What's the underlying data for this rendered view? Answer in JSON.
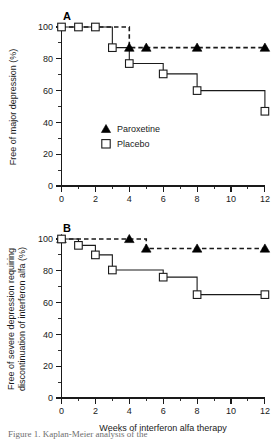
{
  "figure": {
    "panels": [
      {
        "letter": "A",
        "ylabel": "Free of major depression (%)",
        "xlabel": "",
        "legend": [
          {
            "label": "Paroxetine",
            "marker": "filled-triangle-icon"
          },
          {
            "label": "Placebo",
            "marker": "open-square-icon"
          }
        ]
      },
      {
        "letter": "B",
        "ylabel_line1": "Free of severe depression requiring",
        "ylabel_line2": "discontinuation of interferon alfa (%)",
        "xlabel": "Weeks of interferon alfa therapy",
        "legend": []
      }
    ],
    "caption_partial": "Figure 1. Kaplan-Meier analysis of the"
  },
  "chart_data": [
    {
      "type": "line",
      "title": "A",
      "subtitle": "",
      "xlabel": "",
      "ylabel": "Free of major depression (%)",
      "xlim": [
        0,
        12
      ],
      "ylim": [
        0,
        100
      ],
      "xticks": [
        0,
        2,
        4,
        6,
        8,
        10,
        12
      ],
      "xtick_labels": [
        "0",
        "2",
        "4",
        "6",
        "8",
        "10",
        "12"
      ],
      "yticks": [
        0,
        20,
        40,
        60,
        80,
        100
      ],
      "ytick_labels": [
        "0",
        "20",
        "40",
        "60",
        "80",
        "100"
      ],
      "x_minor_ticks": [
        1,
        3,
        5,
        7,
        9,
        11
      ],
      "y_minor_ticks": [
        10,
        30,
        50,
        70,
        90
      ],
      "grid": false,
      "legend_position": "inside-lower-left",
      "step_interpolation": "post",
      "series": [
        {
          "name": "Paroxetine",
          "line_style": "dashed",
          "marker": "filled-triangle",
          "x": [
            0,
            4,
            12
          ],
          "y": [
            100,
            87,
            87
          ],
          "marker_x": [
            4,
            5,
            8,
            12
          ],
          "marker_y": [
            87,
            87,
            87,
            87
          ]
        },
        {
          "name": "Placebo",
          "line_style": "solid",
          "marker": "open-square",
          "x": [
            0,
            1,
            2,
            3,
            4,
            6,
            8,
            12
          ],
          "y": [
            100,
            100,
            100,
            87,
            77,
            70.5,
            60,
            47
          ],
          "marker_x": [
            0,
            1,
            2,
            3,
            4,
            6,
            8,
            12
          ],
          "marker_y": [
            100,
            100,
            100,
            87,
            77,
            70.5,
            60,
            47
          ]
        }
      ]
    },
    {
      "type": "line",
      "title": "B",
      "subtitle": "",
      "xlabel": "Weeks of interferon alfa therapy",
      "ylabel": "Free of severe depression requiring discontinuation of interferon alfa (%)",
      "xlim": [
        0,
        12
      ],
      "ylim": [
        0,
        100
      ],
      "xticks": [
        0,
        2,
        4,
        6,
        8,
        10,
        12
      ],
      "xtick_labels": [
        "0",
        "2",
        "4",
        "6",
        "8",
        "10",
        "12"
      ],
      "yticks": [
        0,
        20,
        40,
        60,
        80,
        100
      ],
      "ytick_labels": [
        "0",
        "20",
        "40",
        "60",
        "80",
        "100"
      ],
      "x_minor_ticks": [
        1,
        3,
        5,
        7,
        9,
        11
      ],
      "y_minor_ticks": [
        10,
        30,
        50,
        70,
        90
      ],
      "grid": false,
      "legend_position": "none",
      "step_interpolation": "post",
      "series": [
        {
          "name": "Paroxetine",
          "line_style": "dashed",
          "marker": "filled-triangle",
          "x": [
            0,
            5,
            12
          ],
          "y": [
            100,
            94,
            94
          ],
          "marker_x": [
            0,
            4,
            5,
            8,
            12
          ],
          "marker_y": [
            100,
            100,
            94,
            94,
            94
          ]
        },
        {
          "name": "Placebo",
          "line_style": "solid",
          "marker": "open-square",
          "x": [
            0,
            1,
            2,
            3,
            6,
            8,
            12
          ],
          "y": [
            100,
            96,
            90,
            80.5,
            76,
            65,
            65
          ],
          "marker_x": [
            0,
            1,
            2,
            3,
            6,
            8,
            12
          ],
          "marker_y": [
            100,
            96,
            90,
            80.5,
            76,
            65,
            65
          ]
        }
      ]
    }
  ]
}
